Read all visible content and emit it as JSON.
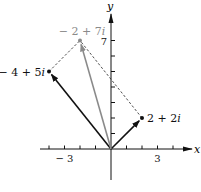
{
  "diagram": {
    "type": "complex-plane-vector-addition",
    "axes": {
      "x_label": "x",
      "y_label": "y",
      "x_ticks": [
        -4,
        -3,
        -2,
        -1,
        1,
        2,
        3,
        4
      ],
      "y_ticks": [
        1,
        2,
        3,
        4,
        5,
        6,
        7
      ],
      "x_tick_labels": [
        {
          "value": -3,
          "text": "− 3"
        },
        {
          "value": 3,
          "text": "3"
        }
      ],
      "y_tick_labels": [
        {
          "value": 7,
          "text": "7"
        }
      ]
    },
    "points": [
      {
        "id": "z1",
        "re": -4,
        "im": 5,
        "label": "− 4 + 5i",
        "color": "#111111"
      },
      {
        "id": "z2",
        "re": 2,
        "im": 2,
        "label": "2 + 2i",
        "color": "#111111"
      },
      {
        "id": "sum",
        "re": -2,
        "im": 7,
        "label": "− 2 + 7i",
        "color": "#8a8a8a"
      }
    ],
    "vectors": [
      {
        "from": "origin",
        "to": "z1",
        "color": "#111111",
        "style": "solid"
      },
      {
        "from": "origin",
        "to": "z2",
        "color": "#111111",
        "style": "solid"
      },
      {
        "from": "origin",
        "to": "sum",
        "color": "#8a8a8a",
        "style": "solid"
      }
    ],
    "parallelogram_edges": [
      {
        "from": "z1",
        "to": "sum",
        "style": "dashed"
      },
      {
        "from": "z2",
        "to": "sum",
        "style": "dashed"
      }
    ]
  }
}
